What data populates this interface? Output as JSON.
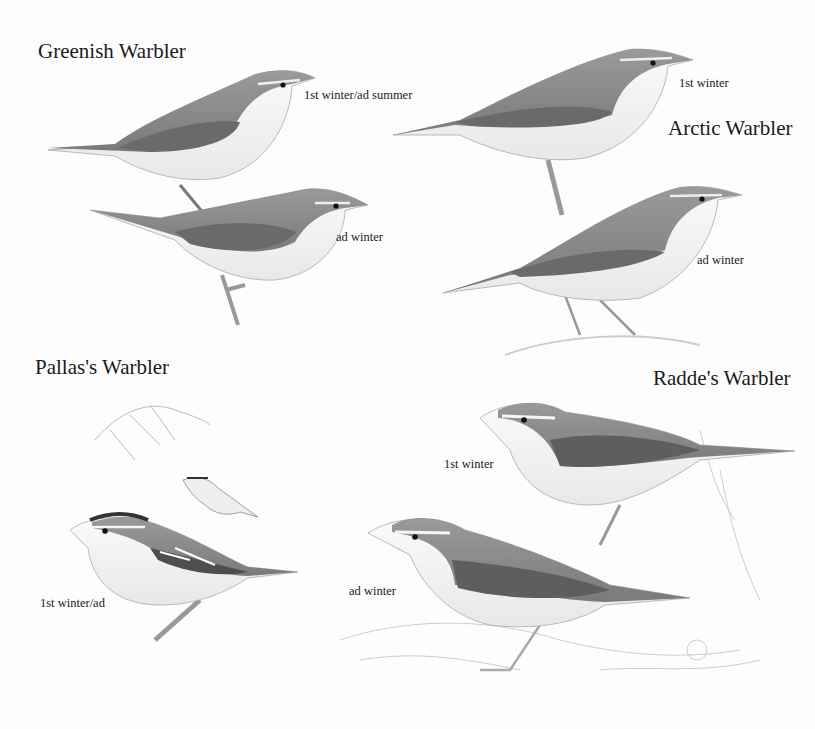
{
  "plate": {
    "species": [
      {
        "name": "Greenish Warbler",
        "figures": [
          {
            "label": "1st winter/ad summer"
          },
          {
            "label": "ad winter"
          }
        ]
      },
      {
        "name": "Arctic Warbler",
        "figures": [
          {
            "label": "1st winter"
          },
          {
            "label": "ad winter"
          }
        ]
      },
      {
        "name": "Pallas's Warbler",
        "figures": [
          {
            "label": "1st winter/ad"
          }
        ]
      },
      {
        "name": "Radde's Warbler",
        "figures": [
          {
            "label": "1st winter"
          },
          {
            "label": "ad winter"
          }
        ]
      }
    ]
  },
  "colors": {
    "background": "#fdfdfd",
    "upperparts": "#8a8a8a",
    "wing": "#6e6e6e",
    "underparts": "#f2f2f2",
    "text": "#1a1a1a"
  }
}
